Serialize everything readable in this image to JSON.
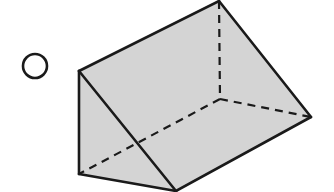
{
  "figure": {
    "type": "triangular-prism",
    "width": 334,
    "height": 192,
    "colors": {
      "background": "#ffffff",
      "face_fill": "#d4d4d4",
      "edge": "#1a1a1a"
    },
    "option_marker": {
      "shape": "radio-circle",
      "cx": 35,
      "cy": 66,
      "r": 12
    },
    "vertices": {
      "A": [
        79,
        71
      ],
      "B": [
        219,
        1
      ],
      "C": [
        311,
        117
      ],
      "D": [
        176,
        191
      ],
      "E": [
        79,
        174
      ],
      "F": [
        220,
        99
      ]
    },
    "visible_edges": [
      [
        "A",
        "B"
      ],
      [
        "B",
        "C"
      ],
      [
        "C",
        "D"
      ],
      [
        "D",
        "E"
      ],
      [
        "E",
        "A"
      ],
      [
        "A",
        "D"
      ]
    ],
    "hidden_edges": [
      [
        "B",
        "F"
      ],
      [
        "F",
        "C"
      ],
      [
        "F",
        "E"
      ]
    ]
  }
}
